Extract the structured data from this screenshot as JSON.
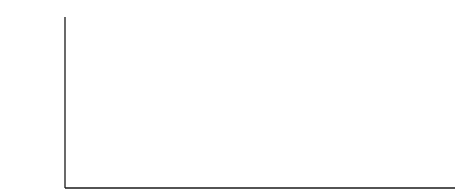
{
  "panel_label": "B.",
  "colors": {
    "line": "#1a1a1a",
    "background": "#ffffff"
  },
  "chart_data": {
    "type": "line",
    "title": "",
    "xlabel": "",
    "ylabel": "",
    "grid": false,
    "legend": null,
    "y_axis": {
      "ticks": 10,
      "tick_labels": []
    },
    "x_axis": {
      "tick_labels": []
    },
    "x_marker_positions": [
      128,
      158,
      241,
      300,
      450
    ],
    "points": [
      [
        65,
        186
      ],
      [
        72,
        184
      ],
      [
        78,
        178
      ],
      [
        83,
        165
      ],
      [
        87,
        140
      ],
      [
        90,
        105
      ],
      [
        93,
        65
      ],
      [
        96,
        36
      ],
      [
        99,
        30
      ],
      [
        103,
        31
      ],
      [
        106,
        32
      ],
      [
        109,
        30
      ],
      [
        112,
        40
      ],
      [
        115,
        75
      ],
      [
        118,
        120
      ],
      [
        121,
        160
      ],
      [
        123,
        178
      ],
      [
        126,
        183
      ],
      [
        130,
        184
      ],
      [
        136,
        180
      ],
      [
        142,
        176
      ],
      [
        150,
        179
      ],
      [
        158,
        183
      ],
      [
        166,
        183
      ],
      [
        174,
        176
      ],
      [
        181,
        166
      ],
      [
        188,
        163
      ],
      [
        196,
        164
      ],
      [
        208,
        170
      ],
      [
        222,
        176
      ],
      [
        236,
        181
      ],
      [
        246,
        182
      ],
      [
        254,
        177
      ],
      [
        260,
        167
      ],
      [
        266,
        162
      ],
      [
        271,
        163
      ],
      [
        278,
        170
      ],
      [
        286,
        177
      ],
      [
        294,
        180
      ],
      [
        302,
        181
      ],
      [
        316,
        179
      ],
      [
        332,
        172
      ],
      [
        348,
        165
      ],
      [
        362,
        160
      ],
      [
        374,
        162
      ],
      [
        390,
        168
      ],
      [
        410,
        176
      ],
      [
        426,
        183
      ],
      [
        436,
        187
      ],
      [
        445,
        188
      ],
      [
        455,
        188
      ]
    ],
    "peaks": [
      {
        "x": 102,
        "relative_height": 0.92
      },
      {
        "x": 142,
        "relative_height": 0.07
      },
      {
        "x": 188,
        "relative_height": 0.15
      },
      {
        "x": 268,
        "relative_height": 0.15
      },
      {
        "x": 362,
        "relative_height": 0.16
      }
    ]
  }
}
